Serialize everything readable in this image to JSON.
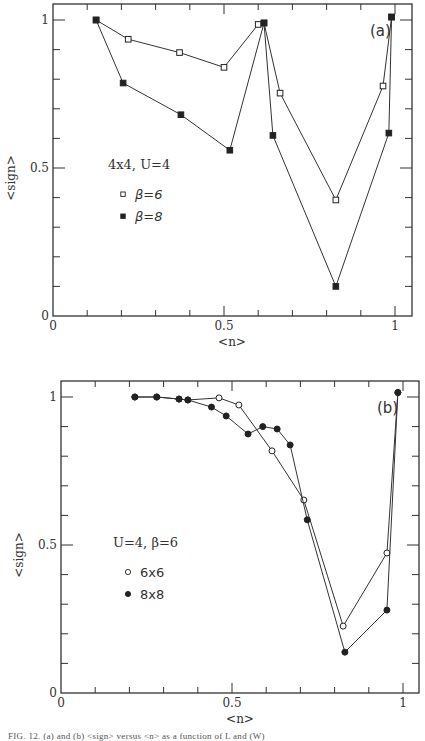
{
  "chart_data": [
    {
      "type": "line",
      "panel_label": "(a)",
      "title": "",
      "xlabel": "<n>",
      "ylabel": "<sign>",
      "xlim": [
        0,
        1.05
      ],
      "ylim": [
        0,
        1.05
      ],
      "xticks": [
        "0",
        "0.5",
        "1"
      ],
      "yticks": [
        "0",
        "0.5",
        "1"
      ],
      "grid": false,
      "legend_title": "4x4, U=4",
      "series": [
        {
          "name": "β=6",
          "marker": "open-square",
          "x": [
            0.126,
            0.22,
            0.37,
            0.5,
            0.6,
            0.617,
            0.664,
            0.827,
            0.965,
            0.99
          ],
          "y": [
            1.0,
            0.935,
            0.89,
            0.84,
            0.985,
            0.99,
            0.753,
            0.392,
            0.777,
            1.01
          ]
        },
        {
          "name": "β=8",
          "marker": "filled-square",
          "x": [
            0.126,
            0.205,
            0.374,
            0.517,
            0.617,
            0.643,
            0.827,
            0.982,
            0.99
          ],
          "y": [
            1.0,
            0.787,
            0.68,
            0.56,
            0.99,
            0.61,
            0.1,
            0.618,
            1.01
          ]
        }
      ]
    },
    {
      "type": "line",
      "panel_label": "(b)",
      "title": "",
      "xlabel": "<n>",
      "ylabel": "<sign>",
      "xlim": [
        0,
        1.05
      ],
      "ylim": [
        0,
        1.05
      ],
      "xticks": [
        "0",
        "0.5",
        "1"
      ],
      "yticks": [
        "0",
        "0.5",
        "1"
      ],
      "grid": false,
      "legend_title": "U=4, β=6",
      "series": [
        {
          "name": "6x6",
          "marker": "open-circle",
          "x": [
            0.216,
            0.28,
            0.345,
            0.371,
            0.462,
            0.52,
            0.617,
            0.71,
            0.825,
            0.953,
            0.985
          ],
          "y": [
            1.0,
            1.0,
            0.993,
            0.99,
            0.997,
            0.973,
            0.818,
            0.652,
            0.226,
            0.473,
            1.015
          ]
        },
        {
          "name": "8x8",
          "marker": "filled-circle",
          "x": [
            0.216,
            0.28,
            0.345,
            0.371,
            0.44,
            0.483,
            0.547,
            0.59,
            0.632,
            0.67,
            0.72,
            0.83,
            0.953,
            0.985
          ],
          "y": [
            1.0,
            1.0,
            0.993,
            0.99,
            0.966,
            0.936,
            0.875,
            0.9,
            0.892,
            0.838,
            0.585,
            0.138,
            0.28,
            1.015
          ]
        }
      ]
    }
  ],
  "caption": "FIG. 12. (a) and (b) <sign> versus <n> as a function of L and (W)"
}
